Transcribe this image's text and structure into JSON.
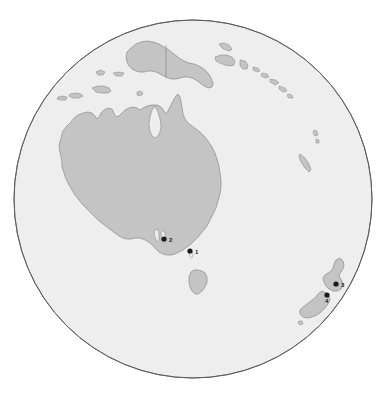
{
  "map": {
    "title": "Orthographic globe map of Australia and New Zealand region",
    "projection": "orthographic",
    "globe": {
      "center_x": 193,
      "center_y": 199,
      "radius": 179,
      "ocean_color": "#eeeeee",
      "outline_color": "#5a5a5a",
      "land_color": "#c4c4c4",
      "land_outline_color": "#888888",
      "border_color": "#9a9a9a",
      "background_color": "#ffffff"
    },
    "markers": [
      {
        "id": "1",
        "label": "1",
        "region": "Australia",
        "x": 190,
        "y": 251,
        "label_x": 195,
        "label_y": 253,
        "color": "#1a1a1a",
        "radius": 2.6
      },
      {
        "id": "2",
        "label": "2",
        "region": "Australia",
        "x": 164,
        "y": 239,
        "label_x": 169,
        "label_y": 241,
        "color": "#1a1a1a",
        "radius": 2.6
      },
      {
        "id": "3",
        "label": "3",
        "region": "New Zealand",
        "x": 336,
        "y": 284,
        "label_x": 341,
        "label_y": 287,
        "color": "#1a1a1a",
        "radius": 2.6
      },
      {
        "id": "4",
        "label": "4",
        "region": "New Zealand",
        "x": 327,
        "y": 295,
        "label_x": 326,
        "label_y": 302,
        "color": "#1a1a1a",
        "radius": 2.6
      }
    ],
    "landmasses": [
      {
        "name": "australia-mainland"
      },
      {
        "name": "tasmania"
      },
      {
        "name": "new-guinea"
      },
      {
        "name": "new-zealand-north-island"
      },
      {
        "name": "new-zealand-south-island"
      },
      {
        "name": "indonesia-islands"
      },
      {
        "name": "solomon-islands"
      },
      {
        "name": "vanuatu-islands"
      },
      {
        "name": "new-caledonia"
      },
      {
        "name": "fiji-islands"
      }
    ]
  }
}
